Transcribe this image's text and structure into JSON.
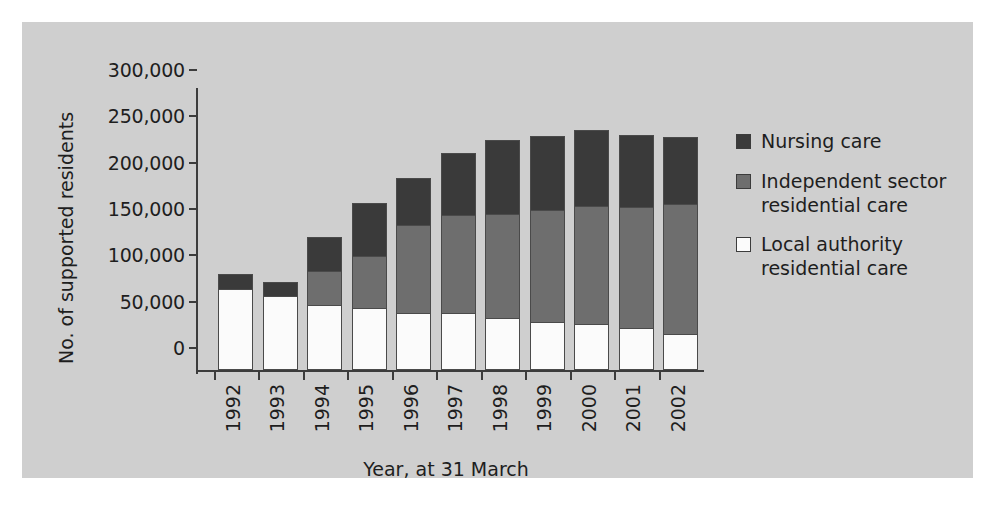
{
  "chart_data": {
    "type": "bar",
    "title": "",
    "xlabel": "Year, at 31 March",
    "ylabel": "No. of supported residents",
    "ylim": [
      0,
      300000
    ],
    "yticks": [
      0,
      50000,
      100000,
      150000,
      200000,
      250000,
      300000
    ],
    "ytick_labels": [
      "0",
      "50,000",
      "100,000",
      "150,000",
      "200,000",
      "250,000",
      "300,000"
    ],
    "grid": false,
    "stacked": true,
    "legend_position": "right",
    "categories": [
      "1992",
      "1993",
      "1994",
      "1995",
      "1996",
      "1997",
      "1998",
      "1999",
      "2000",
      "2001",
      "2002"
    ],
    "series": [
      {
        "name": "Local authority residential care",
        "color": "#fbfbfb",
        "values": [
          87000,
          80000,
          70000,
          67000,
          62000,
          61000,
          56000,
          52000,
          50000,
          45000,
          39000
        ]
      },
      {
        "name": "Independent sector residential care",
        "color": "#6e6e6e",
        "values": [
          0,
          0,
          39000,
          58000,
          96000,
          108000,
          114000,
          122000,
          129000,
          133000,
          142000
        ]
      },
      {
        "name": "Nursing care",
        "color": "#3a3a3a",
        "values": [
          18000,
          17000,
          38000,
          59000,
          52000,
          68000,
          81000,
          82000,
          83000,
          79000,
          74000
        ]
      }
    ],
    "totals": [
      105000,
      97000,
      147000,
      184000,
      210000,
      237000,
      251000,
      256000,
      262000,
      257000,
      255000
    ]
  },
  "legend": {
    "items": [
      {
        "label": "Nursing care",
        "swatch": "#3a3a3a"
      },
      {
        "label": "Independent sector residential care",
        "swatch": "#6e6e6e"
      },
      {
        "label": "Local authority residential care",
        "swatch": "#fbfbfb"
      }
    ]
  },
  "colors": {
    "panel_background": "#cfcfcf",
    "page_background": "#ffffff",
    "axis": "#3c3c3c",
    "text": "#1e1e1e",
    "nursing": "#3a3a3a",
    "independent": "#6e6e6e",
    "local_authority": "#fbfbfb"
  }
}
